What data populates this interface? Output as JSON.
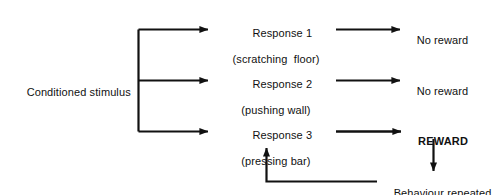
{
  "diagram": {
    "type": "flowchart",
    "colors": {
      "background": "#ffffff",
      "stroke": "#111111",
      "text": "#111111"
    },
    "stimulus": {
      "label": "Conditioned stimulus"
    },
    "responses": [
      {
        "name": "Response 1",
        "description": "(scratching  floor)",
        "outcome": "No reward",
        "outcome_emphasis": "normal"
      },
      {
        "name": "Response 2",
        "description": "(pushing wall)",
        "outcome": "No reward",
        "outcome_emphasis": "normal"
      },
      {
        "name": "Response 3",
        "description": "(pressing bar)",
        "outcome": "REWARD",
        "outcome_emphasis": "bold"
      }
    ],
    "feedback": {
      "label": "Behaviour repeated"
    }
  }
}
